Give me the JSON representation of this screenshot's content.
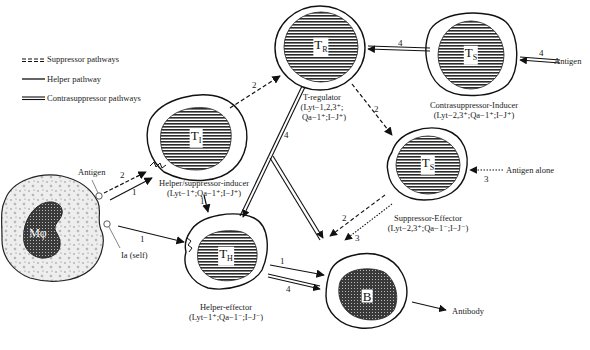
{
  "legend": {
    "items": [
      {
        "style": "dashed",
        "label": "Suppressor pathways"
      },
      {
        "style": "solid",
        "label": "Helper pathway"
      },
      {
        "style": "double",
        "label": "Contrasuppressor pathways"
      }
    ]
  },
  "cells": {
    "macrophage": {
      "symbol": "Mφ",
      "labels": {
        "antigen": "Antigen",
        "ia": "Ia (self)"
      }
    },
    "ti": {
      "symbol": "T",
      "sub": "I",
      "name": "Helper/suppressor-inducer",
      "markers": "(Lyt−1⁺;Qa−1⁺;I−J⁺)"
    },
    "tr": {
      "symbol": "T",
      "sub": "R",
      "name": "T-regulator",
      "markers1": "(Lyt−1,2,3⁺;",
      "markers2": "Qa−1⁺;I−J⁺)"
    },
    "tcs": {
      "symbol": "T",
      "sub": "S",
      "name": "Contrasuppressor-Inducer",
      "markers": "(Lyt−2,3⁺;Qa−1⁺;I−J⁺)"
    },
    "ts": {
      "symbol": "T",
      "sub": "S",
      "name": "Suppressor-Effector",
      "markers": "(Lyt−2,3⁺;Qa−1⁻;I−J⁻)"
    },
    "th": {
      "symbol": "T",
      "sub": "H",
      "name": "Helper-effector",
      "markers": "(Lyt−1⁺;Qa−1⁻;I−J⁻)"
    },
    "b": {
      "symbol": "B"
    }
  },
  "external": {
    "antigen_right": "Antigen",
    "antigen_alone": "Antigen alone",
    "antibody": "Antibody"
  },
  "pathway_numbers": {
    "mo_ti_dashed": "2",
    "mo_ti_solid": "1",
    "mo_th": "1",
    "ti_th": "1",
    "ti_tr": "2",
    "tr_ts": "2",
    "tcs_tr": "4",
    "antigen_tcs": "4",
    "tr_th": "4",
    "antigen_ts": "3",
    "ts_b_dashed": "2",
    "ts_b_dotted": "3",
    "th_b_solid": "1",
    "th_b_double": "4"
  }
}
